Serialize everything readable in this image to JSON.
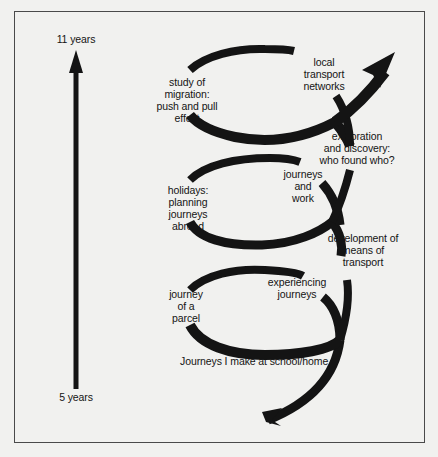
{
  "diagram": {
    "type": "spiral-curriculum",
    "axis": {
      "top_label": "11 years",
      "bottom_label": "5 years",
      "direction": "up"
    },
    "topics": [
      {
        "id": "school-home",
        "lines": [
          "Journeys I make at school/home"
        ]
      },
      {
        "id": "parcel",
        "lines": [
          "journey",
          "of a",
          "parcel"
        ]
      },
      {
        "id": "experiencing",
        "lines": [
          "experiencing",
          "journeys"
        ]
      },
      {
        "id": "means-of-transport",
        "lines": [
          "development of",
          "means of",
          "transport"
        ]
      },
      {
        "id": "holidays",
        "lines": [
          "holidays:",
          "planning",
          "journeys",
          "abroad"
        ]
      },
      {
        "id": "journeys-work",
        "lines": [
          "journeys",
          "and",
          "work"
        ]
      },
      {
        "id": "exploration",
        "lines": [
          "exploration",
          "and discovery:",
          "who found who?"
        ]
      },
      {
        "id": "migration",
        "lines": [
          "study of",
          "migration:",
          "push and pull",
          "effect"
        ]
      },
      {
        "id": "local-transport",
        "lines": [
          "local",
          "transport",
          "networks"
        ]
      }
    ],
    "colors": {
      "ink": "#141414",
      "paper": "#f1f1ef",
      "border": "#4a4a4a"
    }
  }
}
